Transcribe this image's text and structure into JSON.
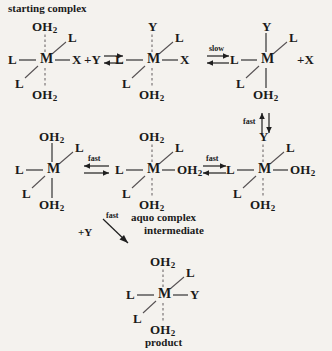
{
  "diagram": {
    "title_text": "starting complex",
    "background_color": "#f4f2ee",
    "ink_color": "#1a1a1a",
    "bond_color": "#2a2a2a",
    "dashed_bond_color": "#6a6466",
    "captions": {
      "starting_complex": "starting complex",
      "aquo_line1": "aquo complex",
      "aquo_line2": "intermediate",
      "product": "product"
    },
    "atoms": {
      "metal": "M",
      "ligand": "L",
      "leaving_group": "X",
      "entering_group": "Y",
      "water_sym": "OH",
      "water_sub": "2"
    },
    "reagents": {
      "plus_y": "+Y",
      "plus_x": "+X"
    },
    "rates": {
      "slow": "slow",
      "fast": "fast"
    },
    "structures": [
      {
        "id": "structure-1",
        "name": "starting-complex",
        "caption": "starting complex",
        "center": "M",
        "top": "OH2",
        "top_bond": "dashed",
        "bottom": "OH2",
        "bottom_bond": "dashed",
        "left": "L",
        "right": "X",
        "upper_right": "L",
        "lower_left": "L"
      },
      {
        "id": "structure-2",
        "name": "y-adduct-with-x",
        "caption": "",
        "center": "M",
        "top": "Y",
        "top_bond": "dashed",
        "bottom": "OH2",
        "bottom_bond": "dashed",
        "left": "L",
        "right": "X",
        "upper_right": "L",
        "lower_left": "L"
      },
      {
        "id": "structure-3",
        "name": "five-coordinate-y-complex",
        "caption": "",
        "center": "M",
        "top": "Y",
        "top_bond": "solid",
        "bottom": "OH2",
        "bottom_bond": "solid",
        "left": "L",
        "right": "",
        "upper_right": "L",
        "lower_left": "L"
      },
      {
        "id": "structure-4",
        "name": "five-coordinate-aquo-complex",
        "caption": "",
        "center": "M",
        "top": "OH2",
        "top_bond": "solid",
        "bottom": "OH2",
        "bottom_bond": "solid",
        "left": "L",
        "right": "",
        "upper_right": "L",
        "lower_left": "L"
      },
      {
        "id": "structure-5",
        "name": "aquo-complex-intermediate",
        "caption": "aquo complex intermediate",
        "center": "M",
        "top": "OH2",
        "top_bond": "dashed",
        "bottom": "OH2",
        "bottom_bond": "dashed",
        "left": "L",
        "right": "OH2",
        "upper_right": "L",
        "lower_left": "L"
      },
      {
        "id": "structure-6",
        "name": "y-aquo-complex",
        "caption": "",
        "center": "M",
        "top": "Y",
        "top_bond": "dashed",
        "bottom": "OH2",
        "bottom_bond": "dashed",
        "left": "L",
        "right": "OH2",
        "upper_right": "L",
        "lower_left": "L"
      },
      {
        "id": "structure-7",
        "name": "product-complex",
        "caption": "product",
        "center": "M",
        "top": "OH2",
        "top_bond": "dashed",
        "bottom": "OH2",
        "bottom_bond": "dashed",
        "left": "L",
        "right": "Y",
        "upper_right": "L",
        "lower_left": "L"
      }
    ],
    "arrows": [
      {
        "id": "arrow-1",
        "name": "equilibrium-1",
        "type": "equilibrium-horizontal",
        "label": ""
      },
      {
        "id": "arrow-2",
        "name": "equilibrium-slow",
        "type": "equilibrium-horizontal",
        "label": "slow"
      },
      {
        "id": "arrow-3",
        "name": "equilibrium-fast-vertical",
        "type": "equilibrium-vertical",
        "label": "fast"
      },
      {
        "id": "arrow-4",
        "name": "equilibrium-fast-left",
        "type": "equilibrium-horizontal",
        "label": "fast"
      },
      {
        "id": "arrow-5",
        "name": "equilibrium-fast-right",
        "type": "equilibrium-horizontal",
        "label": "fast"
      },
      {
        "id": "arrow-6",
        "name": "diagonal-fast-arrow",
        "type": "single-diagonal",
        "label": "fast"
      }
    ]
  }
}
